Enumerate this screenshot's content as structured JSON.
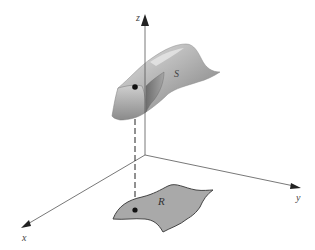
{
  "diagram": {
    "axes": {
      "x": {
        "label": "x"
      },
      "y": {
        "label": "y"
      },
      "z": {
        "label": "z"
      }
    },
    "surface": {
      "label": "S"
    },
    "region": {
      "label": "R"
    },
    "colors": {
      "axis": "#555555",
      "region_fill": "#a9a9a9",
      "region_stroke": "#444444",
      "surface_light": "#d8d8d8",
      "surface_mid": "#b0b0b0",
      "surface_dark": "#7d7d7d",
      "point": "#111111"
    }
  }
}
